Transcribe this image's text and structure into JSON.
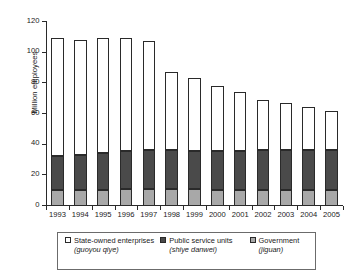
{
  "chart_data": {
    "type": "bar",
    "subtype": "stacked-bar",
    "title": "",
    "xlabel": "",
    "ylabel": "Million employees",
    "ylim": [
      0,
      120
    ],
    "yticks": [
      0,
      20,
      40,
      60,
      80,
      100,
      120
    ],
    "grid": false,
    "legend_position": "bottom",
    "stack_order_bottom_to_top": [
      "Government (jiguan)",
      "Public service units (shiye danwei)",
      "State-owned enterprises (guoyou qiye)"
    ],
    "categories": [
      "1993",
      "1994",
      "1995",
      "1996",
      "1997",
      "1998",
      "1999",
      "2000",
      "2001",
      "2002",
      "2003",
      "2004",
      "2005"
    ],
    "series": [
      {
        "name": "Government (jiguan)",
        "color": "#a8a8a8",
        "values": [
          10.3,
          10.4,
          10.5,
          10.9,
          11.0,
          11.0,
          10.8,
          10.6,
          10.5,
          10.7,
          10.7,
          10.6,
          10.5
        ]
      },
      {
        "name": "Public service units (shiye danwei)",
        "color": "#4a4a4a",
        "values": [
          22.6,
          22.9,
          23.8,
          24.8,
          25.4,
          25.4,
          25.3,
          25.4,
          25.7,
          25.6,
          25.6,
          25.7,
          25.8
        ]
      },
      {
        "name": "State-owned enterprises (guoyou qiye)",
        "color": "#ffffff",
        "values": [
          77.0,
          75.3,
          75.4,
          73.9,
          71.4,
          51.1,
          47.1,
          42.6,
          38.2,
          33.1,
          31.1,
          28.4,
          25.9
        ]
      }
    ],
    "totals": [
      109.9,
      108.6,
      109.7,
      109.6,
      107.8,
      87.5,
      83.2,
      78.6,
      74.4,
      69.4,
      67.4,
      64.7,
      62.2
    ]
  },
  "axes": {
    "y_title": "Million employees",
    "y_tick_labels": [
      "0",
      "20",
      "40",
      "60",
      "80",
      "100",
      "120"
    ],
    "x_tick_labels": [
      "1993",
      "1994",
      "1995",
      "1996",
      "1997",
      "1998",
      "1999",
      "2000",
      "2001",
      "2002",
      "2003",
      "2004",
      "2005"
    ]
  },
  "legend": {
    "items": [
      {
        "label": "State-owned enterprises",
        "romanization": "(guoyou qiye)",
        "swatch": "white-square-outline"
      },
      {
        "label": "Public service units",
        "romanization": "(shiye danwei)",
        "swatch": "dark-grey-square"
      },
      {
        "label": "Government",
        "romanization": "(jiguan)",
        "swatch": "light-grey-square"
      }
    ]
  },
  "colors": {
    "state_owned_enterprises": "#ffffff",
    "public_service_units": "#4a4a4a",
    "government": "#a8a8a8",
    "axis": "#2a2a2a",
    "text": "#1a1a1a",
    "legend_border": "#6b6b6b"
  }
}
